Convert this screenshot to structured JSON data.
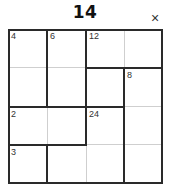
{
  "puzzle": {
    "title": "14",
    "close_icon": "×",
    "size": 4,
    "cages": [
      {
        "clue": "4",
        "cells": [
          [
            0,
            0
          ],
          [
            1,
            0
          ]
        ]
      },
      {
        "clue": "6",
        "cells": [
          [
            0,
            1
          ],
          [
            1,
            1
          ]
        ]
      },
      {
        "clue": "12",
        "cells": [
          [
            0,
            2
          ],
          [
            0,
            3
          ]
        ]
      },
      {
        "clue": "8",
        "cells": [
          [
            1,
            3
          ],
          [
            2,
            3
          ],
          [
            3,
            3
          ]
        ]
      },
      {
        "clue": "2",
        "cells": [
          [
            2,
            0
          ],
          [
            2,
            1
          ]
        ]
      },
      {
        "clue": "24",
        "cells": [
          [
            1,
            2
          ],
          [
            2,
            2
          ]
        ]
      },
      {
        "clue": "3",
        "cells": [
          [
            3,
            0
          ]
        ]
      },
      {
        "clue": "",
        "cells": [
          [
            3,
            1
          ],
          [
            3,
            2
          ]
        ]
      }
    ],
    "clue_cells": {
      "r0c0": "4",
      "r0c1": "6",
      "r0c2": "12",
      "r1c3": "8",
      "r2c0": "2",
      "r2c2": "24",
      "r3c0": "3"
    }
  }
}
